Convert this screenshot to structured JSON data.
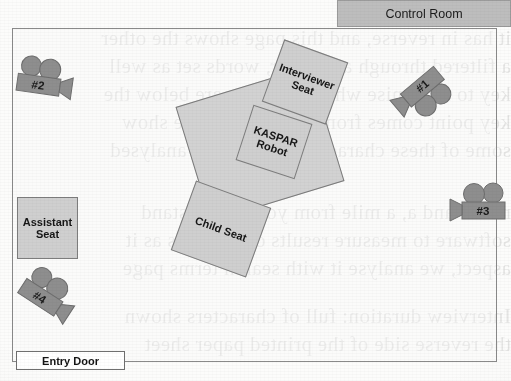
{
  "diagram": {
    "room": {
      "name": "experiment-room"
    },
    "control_room": {
      "label": "Control Room",
      "color": "#bdbdbd"
    },
    "entry_door": {
      "label": "Entry Door"
    },
    "furniture": [
      {
        "id": "interviewer-seat",
        "label": "Interviewer\nSeat",
        "label_line1": "Interviewer",
        "label_line2": "Seat",
        "rotation": 20,
        "color": "#cfcfcf"
      },
      {
        "id": "table",
        "label": "",
        "label_line1": "",
        "label_line2": "",
        "rotation": -17,
        "color": "#d2d2d2"
      },
      {
        "id": "kaspar-robot",
        "label": "KASPAR\nRobot",
        "label_line1": "KASPAR",
        "label_line2": "Robot",
        "rotation": 18,
        "color": "#cfcfcf"
      },
      {
        "id": "child-seat",
        "label": "Child Seat",
        "label_line1": "Child Seat",
        "label_line2": "",
        "rotation": 20,
        "color": "#cfcfcf"
      },
      {
        "id": "assistant-seat",
        "label": "Assistant\nSeat",
        "label_line1": "Assistant",
        "label_line2": "Seat",
        "rotation": 0,
        "color": "#cfcfcf"
      }
    ],
    "cameras": [
      {
        "id": "camera-1",
        "label": "#1",
        "rotation": 45,
        "facing": "down-left"
      },
      {
        "id": "camera-2",
        "label": "#2",
        "rotation": 8,
        "facing": "right"
      },
      {
        "id": "camera-3",
        "label": "#3",
        "rotation": 0,
        "facing": "left"
      },
      {
        "id": "camera-4",
        "label": "#4",
        "rotation": 35,
        "facing": "right-down"
      }
    ],
    "camera_color": "#8e8e8e"
  },
  "bleedthrough": {
    "lines": [
      "it has in reverse, and this page shows the other",
      "a filtered through a scanner, words set as well",
      "key to recognise what the marks are below the",
      "key point comes from the traces of the show",
      "some of these characters can be also analysed",
      "ration and a, a mile from your main, stand",
      "software to measure results of the lines as it",
      "aspect, we analyse it with search terms page",
      "Interview duration: full of characters shown",
      "the reverse side of the printed paper sheet"
    ]
  }
}
